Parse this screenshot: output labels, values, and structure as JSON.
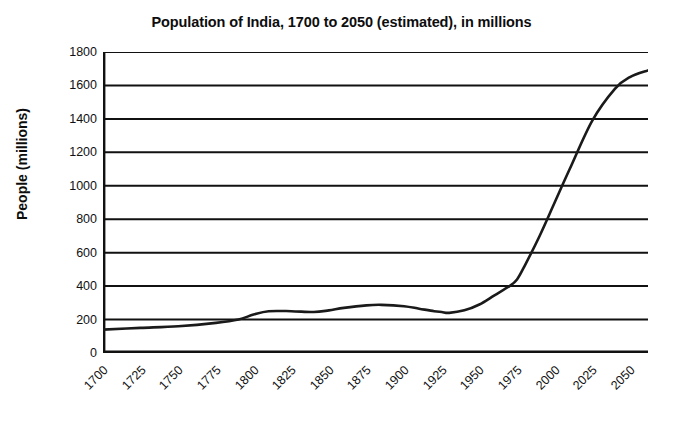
{
  "chart_data": {
    "type": "line",
    "title": "Population of India, 1700 to 2050 (estimated), in millions",
    "xlabel": "",
    "ylabel": "People (millions)",
    "xlim": [
      1700,
      2062
    ],
    "ylim": [
      0,
      1800
    ],
    "grid": "horizontal",
    "legend": "none",
    "series_name": "Population of India",
    "line_color": "#1a1a1a",
    "x_tick_labels": [
      "1700",
      "1725",
      "1750",
      "1775",
      "1800",
      "1825",
      "1850",
      "1875",
      "1900",
      "1925",
      "1950",
      "1975",
      "2000",
      "2025",
      "2050"
    ],
    "y_tick_labels": [
      "0",
      "200",
      "400",
      "600",
      "800",
      "1000",
      "1200",
      "1400",
      "1600",
      "1800"
    ],
    "y_ticks": [
      0,
      200,
      400,
      600,
      800,
      1000,
      1200,
      1400,
      1600,
      1800
    ],
    "x": [
      1700,
      1725,
      1750,
      1775,
      1790,
      1800,
      1810,
      1825,
      1840,
      1850,
      1860,
      1875,
      1885,
      1900,
      1910,
      1920,
      1925,
      1930,
      1940,
      1950,
      1960,
      1970,
      1975,
      1980,
      1990,
      2000,
      2010,
      2025,
      2040,
      2050,
      2062
    ],
    "values": [
      140,
      150,
      160,
      180,
      200,
      230,
      250,
      250,
      245,
      255,
      270,
      285,
      288,
      280,
      265,
      250,
      245,
      240,
      255,
      290,
      345,
      400,
      440,
      520,
      700,
      900,
      1100,
      1390,
      1580,
      1650,
      1690
    ],
    "annotations": []
  },
  "units": "millions"
}
